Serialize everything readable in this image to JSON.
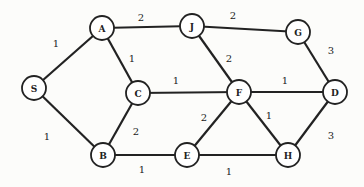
{
  "graph": {
    "nodes": [
      {
        "id": "S",
        "label": "S",
        "x": 34,
        "y": 88
      },
      {
        "id": "A",
        "label": "A",
        "x": 102,
        "y": 28
      },
      {
        "id": "J",
        "label": "J",
        "x": 192,
        "y": 26
      },
      {
        "id": "G",
        "label": "G",
        "x": 298,
        "y": 32
      },
      {
        "id": "C",
        "label": "C",
        "x": 138,
        "y": 93
      },
      {
        "id": "F",
        "label": "F",
        "x": 239,
        "y": 92
      },
      {
        "id": "D",
        "label": "D",
        "x": 335,
        "y": 92
      },
      {
        "id": "B",
        "label": "B",
        "x": 103,
        "y": 155
      },
      {
        "id": "E",
        "label": "E",
        "x": 187,
        "y": 155
      },
      {
        "id": "H",
        "label": "H",
        "x": 288,
        "y": 155
      }
    ],
    "edges": [
      {
        "from": "S",
        "to": "A",
        "weight": "1",
        "lx": 56,
        "ly": 43
      },
      {
        "from": "S",
        "to": "B",
        "weight": "1",
        "lx": 47,
        "ly": 136
      },
      {
        "from": "A",
        "to": "J",
        "weight": "2",
        "lx": 141,
        "ly": 17
      },
      {
        "from": "A",
        "to": "C",
        "weight": "1",
        "lx": 132,
        "ly": 58
      },
      {
        "from": "J",
        "to": "G",
        "weight": "2",
        "lx": 233,
        "ly": 15
      },
      {
        "from": "J",
        "to": "F",
        "weight": "2",
        "lx": 229,
        "ly": 58
      },
      {
        "from": "G",
        "to": "D",
        "weight": "3",
        "lx": 331,
        "ly": 50
      },
      {
        "from": "C",
        "to": "F",
        "weight": "1",
        "lx": 176,
        "ly": 80
      },
      {
        "from": "F",
        "to": "D",
        "weight": "1",
        "lx": 285,
        "ly": 80
      },
      {
        "from": "C",
        "to": "B",
        "weight": "2",
        "lx": 136,
        "ly": 131
      },
      {
        "from": "F",
        "to": "E",
        "weight": "2",
        "lx": 204,
        "ly": 117
      },
      {
        "from": "F",
        "to": "H",
        "weight": "1",
        "lx": 269,
        "ly": 115
      },
      {
        "from": "B",
        "to": "E",
        "weight": "1",
        "lx": 142,
        "ly": 169
      },
      {
        "from": "E",
        "to": "H",
        "weight": "1",
        "lx": 229,
        "ly": 171
      },
      {
        "from": "H",
        "to": "D",
        "weight": "3",
        "lx": 331,
        "ly": 135
      }
    ],
    "node_radius": 12
  }
}
